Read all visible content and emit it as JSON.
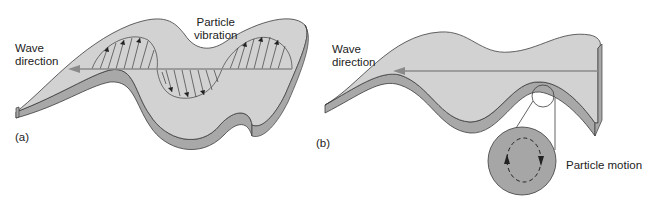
{
  "panel_a": {
    "label": "(a)",
    "wave_direction": "Wave\ndirection",
    "particle_vibration": "Particle\nvibration"
  },
  "panel_b": {
    "label": "(b)",
    "wave_direction": "Wave\ndirection",
    "particle_motion": "Particle motion"
  },
  "colors": {
    "surface": "#d2d2d2",
    "side": "#a8a8a8",
    "outline": "#3c3c3c",
    "arrow": "#8a8a8a",
    "inset": "#a6a6a6"
  }
}
